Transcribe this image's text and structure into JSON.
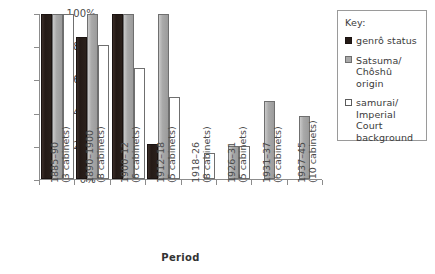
{
  "chart_data": {
    "type": "bar",
    "title": "",
    "xlabel": "Period",
    "ylabel": "",
    "ylim": [
      0,
      100
    ],
    "ytick_labels": [
      "100%",
      "80%",
      "60%",
      "40%",
      "20%",
      "0%"
    ],
    "ytick_values": [
      100,
      80,
      60,
      40,
      20,
      0
    ],
    "grid": false,
    "legend_position": "right",
    "legend_title": "Key:",
    "categories": [
      "1885–90\n(3 cabinets)",
      "1890–1900\n(8 cabinets)",
      "1900–12\n(6 cabinets)",
      "1912–18\n(5 cabinets)",
      "1918–26\n(8 cabinets)",
      "1926–31\n(5 cabinets)",
      "1931–37\n(6 cabinets)",
      "1937–45\n(10 cabinets)"
    ],
    "category_lines": [
      {
        "period": "1885–90",
        "cabinets": "(3 cabinets)"
      },
      {
        "period": "1890–1900",
        "cabinets": "(8 cabinets)"
      },
      {
        "period": "1900–12",
        "cabinets": "(6 cabinets)"
      },
      {
        "period": "1912–18",
        "cabinets": "(5 cabinets)"
      },
      {
        "period": "1918–26",
        "cabinets": "(8 cabinets)"
      },
      {
        "period": "1926–31",
        "cabinets": "(5 cabinets)"
      },
      {
        "period": "1931–37",
        "cabinets": "(6 cabinets)"
      },
      {
        "period": "1937–45",
        "cabinets": "(10 cabinets)"
      }
    ],
    "series": [
      {
        "name": "genrô status",
        "key": "genro",
        "color": "#241a16",
        "values": [
          100,
          86,
          100,
          21,
          0,
          0,
          0,
          0
        ]
      },
      {
        "name": "Satsuma/ Chôshû origin",
        "key": "origin",
        "color": "#a9a9a9",
        "values": [
          100,
          100,
          100,
          100,
          0,
          20,
          47,
          38
        ]
      },
      {
        "name": "samurai/ Imperial Court background",
        "key": "samurai",
        "color": "#ffffff",
        "values": [
          100,
          81,
          67,
          50,
          16,
          20,
          0,
          0
        ]
      }
    ]
  },
  "legend": {
    "title": "Key:",
    "items": [
      {
        "swatch": "genro",
        "line1": "genrô status",
        "line2": "",
        "line3": ""
      },
      {
        "swatch": "origin",
        "line1": "Satsuma/",
        "line2": "Chôshû origin",
        "line3": ""
      },
      {
        "swatch": "samurai",
        "line1": "samurai/",
        "line2": "Imperial Court",
        "line3": "background"
      }
    ]
  },
  "axis": {
    "x_title": "Period"
  }
}
